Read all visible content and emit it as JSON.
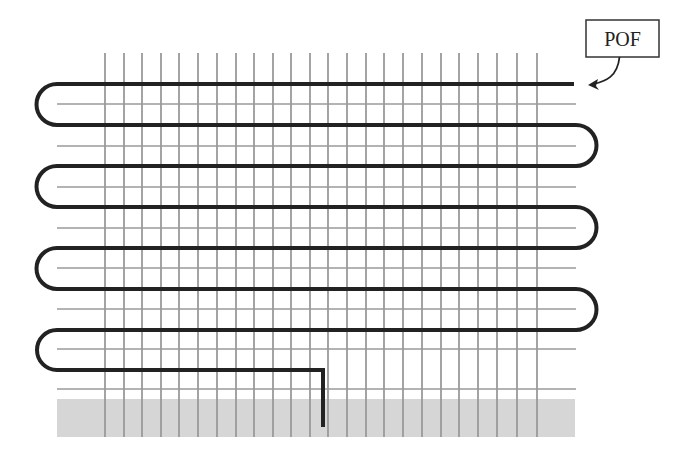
{
  "diagram": {
    "title": "",
    "type": "embedded optical fiber serpentine layout in textile/geogrid mesh",
    "label": {
      "text": "POF",
      "box": {
        "x": 586,
        "y": 20,
        "w": 73,
        "h": 37
      }
    },
    "colors": {
      "background": "#ffffff",
      "grid": "#9a9a9a",
      "fiber": "#222222",
      "base": "#d6d6d6",
      "label_border": "#333333"
    },
    "grid": {
      "vertical_lines_x": [
        105,
        124,
        142,
        161,
        179,
        198,
        217,
        236,
        254,
        273,
        291,
        310,
        328,
        347,
        366,
        384,
        403,
        422,
        441,
        459,
        478,
        497,
        517,
        537
      ],
      "vertical_top": 53,
      "vertical_bottom": 437,
      "horizontal_lines_y": [
        104,
        146,
        187,
        228,
        268,
        309,
        349,
        389
      ],
      "horizontal_left": 57,
      "horizontal_right": 576
    },
    "base_band": {
      "x": 57,
      "y": 399,
      "w": 518,
      "h": 38
    },
    "fiber": {
      "stroke_width": 4,
      "rows_y": [
        84,
        125,
        166,
        207,
        248,
        289,
        330,
        370
      ],
      "left_x": 57,
      "right_x": 576,
      "start_x": 574,
      "exit_x": 323,
      "exit_bottom_y": 427
    }
  }
}
